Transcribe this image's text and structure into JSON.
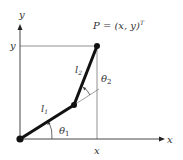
{
  "diagram": {
    "labels": {
      "y_axis": "y",
      "x_axis": "x",
      "y_coord": "y",
      "x_coord": "x",
      "link1": "l",
      "link1_sub": "1",
      "link2": "l",
      "link2_sub": "2",
      "theta1": "θ",
      "theta1_sub": "1",
      "theta2": "θ",
      "theta2_sub": "2",
      "end_effector": "P = (x, y)",
      "end_effector_sup": "T"
    },
    "colors": {
      "link": "#111111",
      "axis": "#333333",
      "guide": "#666666",
      "text": "#333333"
    },
    "points": {
      "base": [
        20,
        139
      ],
      "elbow": [
        74,
        105
      ],
      "end_effector": [
        97,
        46
      ]
    }
  }
}
